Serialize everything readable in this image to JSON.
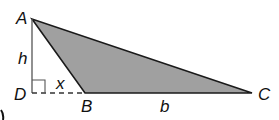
{
  "diagram": {
    "type": "triangle",
    "fill_color": "#a0a0a0",
    "stroke_color": "#1a1a1a",
    "points": {
      "A": {
        "label": "A",
        "x": 32,
        "y": 19
      },
      "B": {
        "label": "B",
        "x": 85,
        "y": 93
      },
      "C": {
        "label": "C",
        "x": 252,
        "y": 93
      },
      "D": {
        "label": "D",
        "x": 32,
        "y": 93
      }
    },
    "segment_labels": {
      "h": "h",
      "x": "x",
      "b": "b"
    }
  }
}
